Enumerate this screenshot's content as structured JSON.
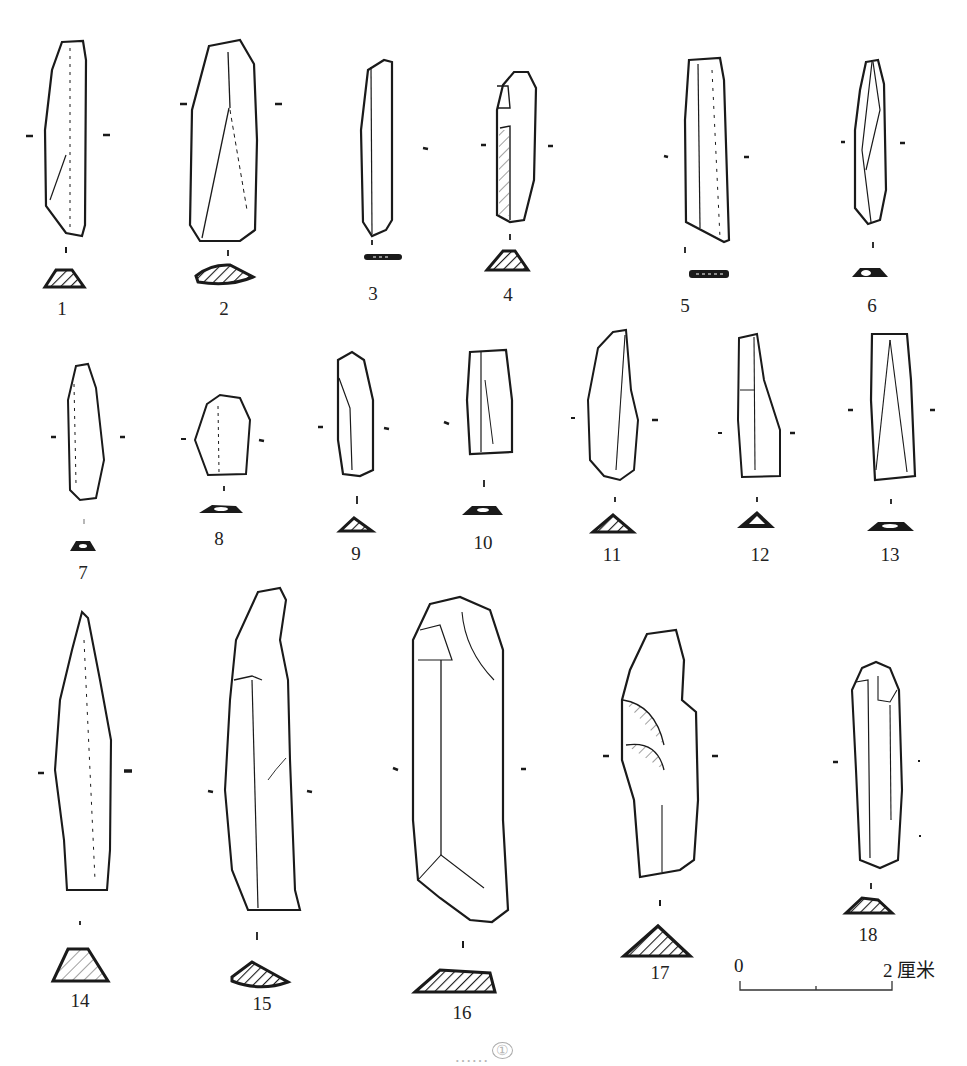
{
  "figure": {
    "type": "archaeological line drawing plate",
    "items": [
      {
        "label": "1"
      },
      {
        "label": "2"
      },
      {
        "label": "3"
      },
      {
        "label": "4"
      },
      {
        "label": "5"
      },
      {
        "label": "6"
      },
      {
        "label": "7"
      },
      {
        "label": "8"
      },
      {
        "label": "9"
      },
      {
        "label": "10"
      },
      {
        "label": "11"
      },
      {
        "label": "12"
      },
      {
        "label": "13"
      },
      {
        "label": "14"
      },
      {
        "label": "15"
      },
      {
        "label": "16"
      },
      {
        "label": "17"
      },
      {
        "label": "18"
      }
    ],
    "scale_bar": {
      "start": "0",
      "end": "2",
      "unit": "厘米"
    },
    "caption": {
      "text": "……",
      "footnote_marker": "①"
    }
  },
  "colors": {
    "ink": "#1a1a1a",
    "paper": "#ffffff",
    "caption_faded": "#b5b5b5"
  }
}
